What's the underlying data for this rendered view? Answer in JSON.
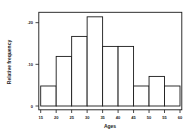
{
  "chart_data": {
    "type": "bar",
    "title": "",
    "xlabel": "Ages",
    "ylabel": "Relative frequency",
    "bins": [
      [
        15,
        20
      ],
      [
        20,
        25
      ],
      [
        25,
        30
      ],
      [
        30,
        35
      ],
      [
        35,
        40
      ],
      [
        40,
        45
      ],
      [
        45,
        50
      ],
      [
        50,
        55
      ],
      [
        55,
        60
      ]
    ],
    "categories": [
      "15-20",
      "20-25",
      "25-30",
      "30-35",
      "35-40",
      "40-45",
      "45-50",
      "50-55",
      "55-60"
    ],
    "values": [
      0.048,
      0.119,
      0.167,
      0.214,
      0.143,
      0.143,
      0.048,
      0.071,
      0.048
    ],
    "x_ticks": [
      15,
      20,
      25,
      30,
      35,
      40,
      45,
      50,
      55,
      60
    ],
    "x_tick_labels": [
      "15",
      "20",
      "25",
      "30",
      "35",
      "40",
      "45",
      "50",
      "55",
      "60"
    ],
    "y_ticks": [
      0,
      0.1,
      0.2
    ],
    "y_tick_labels": [
      "0",
      ".10",
      ".20"
    ],
    "xlim": [
      15,
      60
    ],
    "ylim": [
      0,
      0.235
    ],
    "grid": false,
    "legend": null
  },
  "colors": {
    "bar_fill": "#ffffff",
    "bar_stroke": "#1a1a1a",
    "frame": "#1a1a1a",
    "background": "#ffffff"
  }
}
